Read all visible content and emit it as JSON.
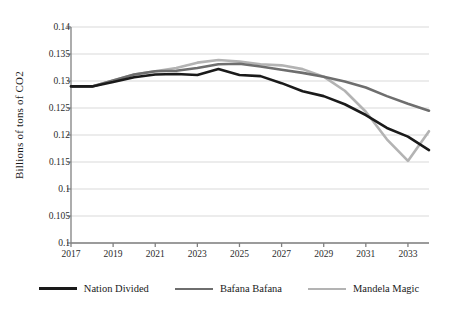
{
  "chart_data": {
    "type": "line",
    "title": "",
    "xlabel": "",
    "ylabel": "Billions of tons of CO2",
    "x": [
      2017,
      2018,
      2019,
      2020,
      2021,
      2022,
      2023,
      2024,
      2025,
      2026,
      2027,
      2028,
      2029,
      2030,
      2031,
      2032,
      2033,
      2034
    ],
    "xtick_labels": [
      "2017",
      "2019",
      "2021",
      "2023",
      "2025",
      "2027",
      "2029",
      "2031",
      "2033"
    ],
    "xticks": [
      2017,
      2019,
      2021,
      2023,
      2025,
      2027,
      2029,
      2031,
      2033
    ],
    "xlim": [
      2017,
      2034
    ],
    "ytick_labels": [
      "0.14",
      "0.135",
      "0.13",
      "0.125",
      "0.12",
      "0.115",
      "0.1",
      "0.105",
      "0.1"
    ],
    "yticks": [
      0.14,
      0.135,
      0.13,
      0.125,
      0.12,
      0.115,
      0.11,
      0.105,
      0.1
    ],
    "ylim": [
      0.1,
      0.14
    ],
    "grid": true,
    "legend_position": "bottom",
    "series": [
      {
        "name": "Nation Divided",
        "color": "#1a1a1a",
        "width": 2.6,
        "values": [
          0.129,
          0.129,
          0.1298,
          0.1307,
          0.1312,
          0.1313,
          0.1311,
          0.1322,
          0.1311,
          0.1309,
          0.1296,
          0.1281,
          0.1272,
          0.1257,
          0.1237,
          0.1213,
          0.1197,
          0.1172
        ]
      },
      {
        "name": "Bafana Bafana",
        "color": "#6e6e6e",
        "width": 2.6,
        "values": [
          0.129,
          0.129,
          0.1301,
          0.1312,
          0.1318,
          0.1319,
          0.1324,
          0.1331,
          0.1332,
          0.1327,
          0.1321,
          0.1315,
          0.1308,
          0.1299,
          0.1288,
          0.1272,
          0.1258,
          0.1245
        ]
      },
      {
        "name": "Mandela Magic",
        "color": "#b3b3b3",
        "width": 2.6,
        "values": [
          0.129,
          0.129,
          0.1301,
          0.1312,
          0.1318,
          0.1324,
          0.1334,
          0.1339,
          0.1336,
          0.1331,
          0.1329,
          0.1322,
          0.1308,
          0.1282,
          0.1243,
          0.1192,
          0.1152,
          0.1207
        ]
      }
    ]
  },
  "legend": {
    "items": [
      {
        "label": "Nation Divided"
      },
      {
        "label": "Bafana Bafana"
      },
      {
        "label": "Mandela Magic"
      }
    ]
  },
  "axes": {
    "y_title": "Billions of tons of CO2"
  }
}
